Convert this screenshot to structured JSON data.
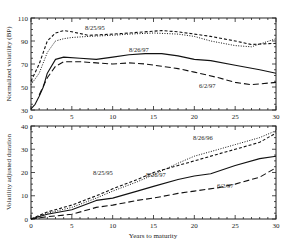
{
  "chart_data": [
    {
      "type": "line",
      "title": "",
      "xlabel": "",
      "ylabel": "Normalized volatility (BP)",
      "xlim": [
        0,
        30
      ],
      "ylim": [
        30,
        110
      ],
      "xticks": [
        0,
        5,
        10,
        15,
        20,
        25,
        30
      ],
      "yticks": [
        30,
        50,
        70,
        90,
        110
      ],
      "grid": false,
      "legend": "inline labels",
      "series": [
        {
          "name": "8/25/95",
          "style": "dashed-short",
          "x": [
            0,
            1,
            2,
            3,
            4,
            5,
            7,
            10,
            12,
            16,
            18,
            20,
            22,
            25,
            27,
            30
          ],
          "values": [
            55,
            70,
            90,
            97,
            99,
            98,
            95,
            96,
            97,
            99,
            98,
            96,
            94,
            90,
            87,
            88
          ]
        },
        {
          "name": "8/26/96",
          "style": "dotted",
          "x": [
            0,
            1,
            2,
            3,
            4,
            5,
            7,
            10,
            12,
            15,
            18,
            20,
            22,
            25,
            27,
            30
          ],
          "values": [
            52,
            62,
            80,
            90,
            92,
            93,
            94,
            95,
            96,
            97,
            96,
            94,
            90,
            86,
            85,
            92
          ]
        },
        {
          "name": "8/26/97",
          "style": "solid",
          "x": [
            0,
            0.5,
            1,
            1.5,
            2,
            3,
            4,
            6,
            8,
            10,
            12,
            14,
            16,
            18,
            20,
            22,
            25,
            28,
            30
          ],
          "values": [
            31,
            35,
            42,
            50,
            62,
            74,
            76,
            75,
            74,
            76,
            78,
            79,
            79,
            77,
            74,
            73,
            69,
            65,
            62
          ]
        },
        {
          "name": "6/2/97",
          "style": "dashed-long",
          "x": [
            1,
            2,
            3,
            4,
            6,
            8,
            10,
            12,
            14,
            16,
            18,
            20,
            23,
            25,
            27,
            30
          ],
          "values": [
            43,
            58,
            68,
            72,
            72,
            71,
            70,
            71,
            70,
            68,
            66,
            63,
            58,
            54,
            52,
            54
          ]
        }
      ],
      "annotations": [
        "8/25/95",
        "8/26/97",
        "6/2/97"
      ]
    },
    {
      "type": "line",
      "title": "",
      "xlabel": "Years to maturity",
      "ylabel": "Volatility adjusted duration",
      "xlim": [
        0,
        30
      ],
      "ylim": [
        0,
        40
      ],
      "xticks": [
        0,
        5,
        10,
        15,
        20,
        25,
        30
      ],
      "yticks": [
        0,
        10,
        20,
        30,
        40
      ],
      "grid": false,
      "legend": "inline labels",
      "series": [
        {
          "name": "8/25/95",
          "style": "dashed-short",
          "x": [
            0,
            2,
            5,
            8,
            10,
            13,
            15,
            18,
            20,
            23,
            25,
            28,
            30
          ],
          "values": [
            0,
            3,
            6,
            10,
            13,
            17,
            20,
            23,
            25,
            28,
            30,
            33,
            37
          ]
        },
        {
          "name": "8/26/96",
          "style": "dotted",
          "x": [
            0,
            2,
            5,
            8,
            10,
            13,
            15,
            18,
            20,
            23,
            25,
            28,
            30
          ],
          "values": [
            0,
            2.5,
            5,
            9,
            12,
            16,
            19,
            24,
            27,
            30,
            32,
            35,
            38
          ]
        },
        {
          "name": "8/26/97",
          "style": "solid",
          "x": [
            0,
            2,
            5,
            8,
            10,
            13,
            15,
            18,
            20,
            22,
            25,
            28,
            30
          ],
          "values": [
            0,
            2,
            4,
            8,
            9,
            12,
            14,
            17,
            18.5,
            19.5,
            23,
            26,
            27
          ]
        },
        {
          "name": "6/2/97",
          "style": "dashed-long",
          "x": [
            0,
            2,
            5,
            8,
            10,
            13,
            15,
            18,
            20,
            23,
            25,
            28,
            30
          ],
          "values": [
            0,
            1,
            2,
            5,
            6,
            8,
            9,
            11,
            12,
            13.5,
            15,
            18,
            22
          ]
        }
      ],
      "annotations": [
        "8/26/96",
        "8/25/95",
        "8/26/97",
        "6/2/97"
      ]
    }
  ],
  "labels": {
    "top_ylabel": "Normalized volatility (BP)",
    "bottom_ylabel": "Volatility adjusted duration",
    "xlabel": "Years to maturity",
    "top_series_labels": {
      "a": "8/25/95",
      "b": "8/26/97",
      "c": "6/2/97"
    },
    "bottom_series_labels": {
      "a": "8/26/96",
      "b": "8/25/95",
      "c": "8/26/97",
      "d": "6/2/97"
    }
  }
}
